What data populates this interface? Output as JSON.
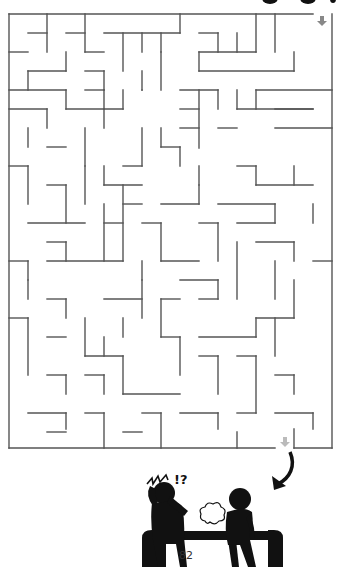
{
  "page": {
    "number": "82",
    "type": "maze puzzle"
  },
  "maze": {
    "origin": [
      9,
      14
    ],
    "cell": 19,
    "cols": 17,
    "rows": 23,
    "wall_color": "#555555",
    "entrance": {
      "label": "start-arrow",
      "x": 322,
      "y": 20,
      "color": "#888888"
    },
    "exit": {
      "label": "end-arrow",
      "x": 285,
      "y": 441,
      "color": "#bbbbbb"
    },
    "walls": [
      [
        9,
        14,
        313,
        14
      ],
      [
        332,
        14,
        332,
        448
      ],
      [
        9,
        14,
        9,
        448
      ],
      [
        9,
        448,
        275,
        448
      ],
      [
        294,
        448,
        332,
        448
      ],
      [
        28,
        33,
        47,
        33
      ],
      [
        47,
        14,
        47,
        52
      ],
      [
        66,
        33,
        85,
        33
      ],
      [
        85,
        14,
        85,
        52
      ],
      [
        85,
        52,
        104,
        52
      ],
      [
        104,
        33,
        180,
        33
      ],
      [
        123,
        33,
        123,
        71
      ],
      [
        142,
        33,
        142,
        52
      ],
      [
        161,
        33,
        161,
        52
      ],
      [
        180,
        14,
        180,
        33
      ],
      [
        199,
        33,
        218,
        33
      ],
      [
        218,
        33,
        218,
        52
      ],
      [
        199,
        52,
        256,
        52
      ],
      [
        237,
        33,
        237,
        52
      ],
      [
        256,
        14,
        256,
        52
      ],
      [
        275,
        14,
        275,
        52
      ],
      [
        294,
        52,
        294,
        71
      ],
      [
        199,
        52,
        199,
        71
      ],
      [
        199,
        71,
        294,
        71
      ],
      [
        9,
        52,
        28,
        52
      ],
      [
        66,
        52,
        66,
        71
      ],
      [
        28,
        71,
        66,
        71
      ],
      [
        28,
        71,
        28,
        90
      ],
      [
        85,
        71,
        104,
        71
      ],
      [
        104,
        71,
        104,
        90
      ],
      [
        161,
        52,
        161,
        90
      ],
      [
        142,
        71,
        142,
        90
      ],
      [
        9,
        90,
        66,
        90
      ],
      [
        66,
        90,
        66,
        109
      ],
      [
        85,
        90,
        104,
        90
      ],
      [
        104,
        90,
        104,
        109
      ],
      [
        123,
        90,
        123,
        109
      ],
      [
        142,
        90,
        142,
        90
      ],
      [
        180,
        90,
        218,
        90
      ],
      [
        218,
        90,
        218,
        109
      ],
      [
        237,
        90,
        237,
        109
      ],
      [
        256,
        90,
        332,
        90
      ],
      [
        256,
        90,
        256,
        109
      ],
      [
        275,
        109,
        313,
        109
      ],
      [
        237,
        109,
        313,
        109
      ],
      [
        9,
        109,
        47,
        109
      ],
      [
        47,
        109,
        47,
        128
      ],
      [
        66,
        109,
        123,
        109
      ],
      [
        104,
        109,
        104,
        128
      ],
      [
        180,
        109,
        199,
        109
      ],
      [
        199,
        90,
        199,
        148
      ],
      [
        180,
        128,
        199,
        128
      ],
      [
        218,
        128,
        237,
        128
      ],
      [
        275,
        128,
        332,
        128
      ],
      [
        28,
        128,
        28,
        147
      ],
      [
        47,
        147,
        66,
        147
      ],
      [
        85,
        128,
        85,
        166
      ],
      [
        142,
        128,
        142,
        166
      ],
      [
        161,
        128,
        161,
        147
      ],
      [
        161,
        147,
        180,
        147
      ],
      [
        180,
        147,
        180,
        166
      ],
      [
        9,
        166,
        28,
        166
      ],
      [
        28,
        166,
        28,
        204
      ],
      [
        85,
        166,
        85,
        204
      ],
      [
        104,
        166,
        104,
        185
      ],
      [
        104,
        185,
        142,
        185
      ],
      [
        123,
        166,
        142,
        166
      ],
      [
        199,
        166,
        199,
        185
      ],
      [
        237,
        166,
        256,
        166
      ],
      [
        256,
        166,
        256,
        185
      ],
      [
        256,
        185,
        313,
        185
      ],
      [
        294,
        166,
        294,
        185
      ],
      [
        47,
        185,
        66,
        185
      ],
      [
        66,
        185,
        66,
        223
      ],
      [
        123,
        204,
        142,
        204
      ],
      [
        161,
        204,
        199,
        204
      ],
      [
        199,
        185,
        199,
        204
      ],
      [
        218,
        204,
        275,
        204
      ],
      [
        275,
        204,
        275,
        223
      ],
      [
        313,
        204,
        313,
        223
      ],
      [
        28,
        223,
        85,
        223
      ],
      [
        104,
        204,
        104,
        261
      ],
      [
        104,
        223,
        123,
        223
      ],
      [
        123,
        185,
        123,
        261
      ],
      [
        142,
        223,
        161,
        223
      ],
      [
        161,
        223,
        161,
        261
      ],
      [
        161,
        261,
        199,
        261
      ],
      [
        199,
        223,
        218,
        223
      ],
      [
        218,
        223,
        218,
        261
      ],
      [
        237,
        223,
        275,
        223
      ],
      [
        256,
        242,
        294,
        242
      ],
      [
        294,
        242,
        294,
        261
      ],
      [
        9,
        261,
        28,
        261
      ],
      [
        28,
        261,
        28,
        280
      ],
      [
        47,
        242,
        66,
        242
      ],
      [
        66,
        242,
        66,
        261
      ],
      [
        47,
        261,
        123,
        261
      ],
      [
        142,
        261,
        142,
        280
      ],
      [
        180,
        280,
        218,
        280
      ],
      [
        218,
        280,
        218,
        299
      ],
      [
        237,
        242,
        237,
        299
      ],
      [
        313,
        261,
        332,
        261
      ],
      [
        275,
        261,
        275,
        299
      ],
      [
        28,
        280,
        28,
        299
      ],
      [
        47,
        299,
        66,
        299
      ],
      [
        66,
        299,
        66,
        318
      ],
      [
        104,
        299,
        142,
        299
      ],
      [
        142,
        280,
        142,
        318
      ],
      [
        161,
        299,
        161,
        337
      ],
      [
        161,
        299,
        180,
        299
      ],
      [
        199,
        299,
        218,
        299
      ],
      [
        256,
        318,
        294,
        318
      ],
      [
        294,
        280,
        294,
        318
      ],
      [
        9,
        318,
        28,
        318
      ],
      [
        28,
        318,
        28,
        375
      ],
      [
        47,
        337,
        66,
        337
      ],
      [
        85,
        318,
        85,
        356
      ],
      [
        85,
        356,
        123,
        356
      ],
      [
        104,
        337,
        104,
        356
      ],
      [
        123,
        318,
        123,
        337
      ],
      [
        161,
        337,
        180,
        337
      ],
      [
        180,
        337,
        180,
        375
      ],
      [
        199,
        337,
        256,
        337
      ],
      [
        256,
        318,
        256,
        337
      ],
      [
        275,
        318,
        275,
        356
      ],
      [
        47,
        375,
        66,
        375
      ],
      [
        66,
        375,
        66,
        394
      ],
      [
        85,
        375,
        104,
        375
      ],
      [
        104,
        375,
        104,
        394
      ],
      [
        123,
        356,
        123,
        394
      ],
      [
        123,
        394,
        180,
        394
      ],
      [
        199,
        356,
        218,
        356
      ],
      [
        218,
        356,
        218,
        394
      ],
      [
        237,
        356,
        256,
        356
      ],
      [
        256,
        356,
        256,
        413
      ],
      [
        275,
        375,
        294,
        375
      ],
      [
        294,
        375,
        294,
        394
      ],
      [
        28,
        413,
        66,
        413
      ],
      [
        66,
        413,
        66,
        429
      ],
      [
        85,
        413,
        104,
        413
      ],
      [
        104,
        413,
        104,
        448
      ],
      [
        142,
        413,
        161,
        413
      ],
      [
        161,
        413,
        161,
        448
      ],
      [
        180,
        413,
        218,
        413
      ],
      [
        218,
        413,
        218,
        429
      ],
      [
        237,
        413,
        256,
        413
      ],
      [
        275,
        413,
        313,
        413
      ],
      [
        313,
        413,
        313,
        429
      ],
      [
        47,
        432,
        66,
        432
      ],
      [
        123,
        432,
        142,
        432
      ],
      [
        237,
        432,
        237,
        448
      ],
      [
        294,
        429,
        294,
        448
      ]
    ]
  },
  "illustration": {
    "description": "two stick figures on a bench, one reacting with shock to a gas cloud",
    "exclamation": "!?",
    "figure_color": "#111111"
  }
}
